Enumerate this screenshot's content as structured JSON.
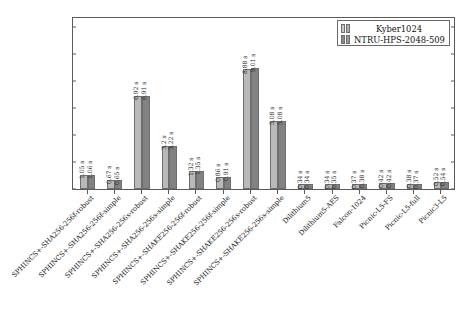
{
  "chart_data": {
    "type": "bar",
    "title": "",
    "xlabel": "",
    "ylabel": "",
    "ylim": [
      0,
      12.7
    ],
    "yticks": [
      0,
      2,
      4,
      6,
      8,
      10,
      12
    ],
    "grid": false,
    "legend_position": "upper right",
    "value_label_suffix": " s",
    "categories": [
      "SPHINCS+-SHA256-256f-robust",
      "SPHINCS+-SHA256-256f-simple",
      "SPHINCS+-SHA256-256s-robust",
      "SPHINCS+-SHA256-256s-simple",
      "SPHINCS+-SHAKE256-256f-robust",
      "SPHINCS+-SHAKE256-256f-simple",
      "SPHINCS+-SHAKE256-256s-robust",
      "SPHINCS+-SHAKE256-256s-simple",
      "Dilithium5",
      "Dilithium5-AES",
      "Falcon-1024",
      "Picnic-L5-FS",
      "Picnic-L5-full",
      "Picnic3-L5"
    ],
    "series": [
      {
        "name": "Kyber1024",
        "color": "#b9b9b9",
        "values": [
          1.05,
          0.67,
          6.92,
          3.2,
          1.32,
          0.86,
          8.88,
          5.08,
          0.34,
          0.34,
          0.37,
          0.42,
          0.38,
          0.52
        ],
        "labels": [
          "1.05 s",
          "0.67 s",
          "6.92 s",
          "3.2 s",
          "1.32 s",
          "0.86 s",
          "8.88 s",
          "5.08 s",
          "0.34 s",
          "0.34 s",
          "0.37 s",
          "0.42 s",
          "0.38 s",
          "0.52 s"
        ]
      },
      {
        "name": "NTRU-HPS-2048-509",
        "color": "#828282",
        "values": [
          1.06,
          0.65,
          6.91,
          3.22,
          1.35,
          0.91,
          9.01,
          5.08,
          0.34,
          0.35,
          0.38,
          0.42,
          0.37,
          0.54
        ],
        "labels": [
          "1.06 s",
          "0.65 s",
          "6.91 s",
          "3.22 s",
          "1.35 s",
          "0.91 s",
          "9.01 s",
          "5.08 s",
          "0.34 s",
          "0.35 s",
          "0.38 s",
          "0.42 s",
          "0.37 s",
          "0.54 s"
        ]
      }
    ]
  },
  "legend": {
    "entries": [
      {
        "label": "Kyber1024"
      },
      {
        "label": "NTRU-HPS-2048-509"
      }
    ]
  }
}
